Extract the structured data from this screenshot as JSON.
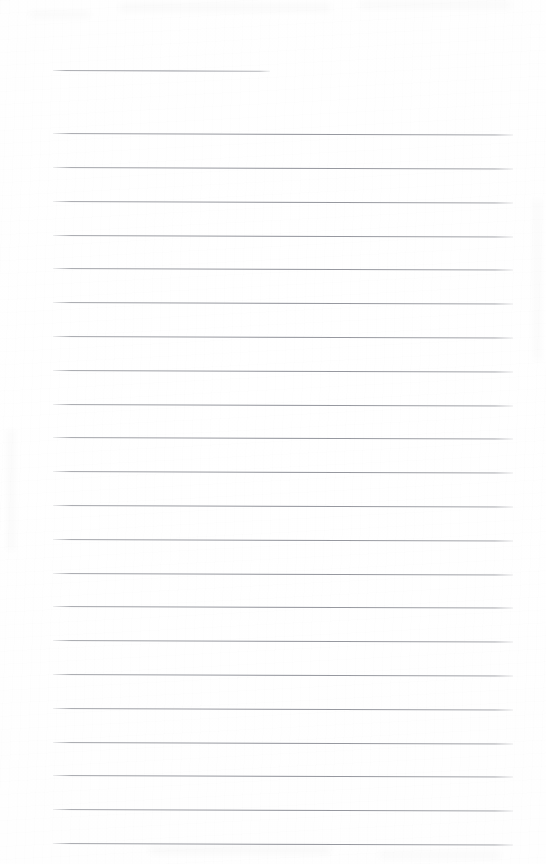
{
  "document": {
    "kind": "blank-ruled-notebook-page",
    "page_width": 546,
    "page_height": 864,
    "background_color": "#fdfdfd",
    "rule_color": "#8e9096",
    "handwriting_text": "",
    "typed_text": "",
    "page_number": "",
    "header_text": "",
    "footer_text": ""
  },
  "layout": {
    "left_margin_x": 53,
    "right_margin_x": 513,
    "first_rule_y": 70,
    "body_first_rule_y": 133,
    "rule_spacing": 33.8,
    "skew_degrees": 0.18
  },
  "rules": [
    {
      "id": "title-rule",
      "y": 70,
      "x_start": 53,
      "x_end": 270,
      "kind": "title"
    },
    {
      "id": "rule-1",
      "y": 133,
      "x_start": 53,
      "x_end": 513,
      "kind": "body"
    },
    {
      "id": "rule-2",
      "y": 167,
      "x_start": 53,
      "x_end": 513,
      "kind": "body"
    },
    {
      "id": "rule-3",
      "y": 201,
      "x_start": 53,
      "x_end": 513,
      "kind": "body"
    },
    {
      "id": "rule-4",
      "y": 235,
      "x_start": 53,
      "x_end": 513,
      "kind": "body"
    },
    {
      "id": "rule-5",
      "y": 268,
      "x_start": 53,
      "x_end": 513,
      "kind": "body"
    },
    {
      "id": "rule-6",
      "y": 302,
      "x_start": 53,
      "x_end": 513,
      "kind": "body"
    },
    {
      "id": "rule-7",
      "y": 336,
      "x_start": 53,
      "x_end": 513,
      "kind": "body"
    },
    {
      "id": "rule-8",
      "y": 370,
      "x_start": 53,
      "x_end": 513,
      "kind": "body"
    },
    {
      "id": "rule-9",
      "y": 404,
      "x_start": 53,
      "x_end": 513,
      "kind": "body"
    },
    {
      "id": "rule-10",
      "y": 437,
      "x_start": 53,
      "x_end": 513,
      "kind": "body"
    },
    {
      "id": "rule-11",
      "y": 471,
      "x_start": 53,
      "x_end": 513,
      "kind": "body"
    },
    {
      "id": "rule-12",
      "y": 505,
      "x_start": 53,
      "x_end": 513,
      "kind": "body"
    },
    {
      "id": "rule-13",
      "y": 539,
      "x_start": 53,
      "x_end": 513,
      "kind": "body"
    },
    {
      "id": "rule-14",
      "y": 573,
      "x_start": 53,
      "x_end": 513,
      "kind": "body"
    },
    {
      "id": "rule-15",
      "y": 606,
      "x_start": 53,
      "x_end": 513,
      "kind": "body"
    },
    {
      "id": "rule-16",
      "y": 640,
      "x_start": 53,
      "x_end": 513,
      "kind": "body"
    },
    {
      "id": "rule-17",
      "y": 674,
      "x_start": 53,
      "x_end": 513,
      "kind": "body"
    },
    {
      "id": "rule-18",
      "y": 708,
      "x_start": 53,
      "x_end": 513,
      "kind": "body"
    },
    {
      "id": "rule-19",
      "y": 742,
      "x_start": 53,
      "x_end": 513,
      "kind": "body"
    },
    {
      "id": "rule-20",
      "y": 775,
      "x_start": 53,
      "x_end": 513,
      "kind": "body"
    },
    {
      "id": "rule-21",
      "y": 809,
      "x_start": 53,
      "x_end": 513,
      "kind": "body"
    },
    {
      "id": "rule-22",
      "y": 843,
      "x_start": 53,
      "x_end": 513,
      "kind": "body"
    }
  ],
  "smudges": [
    {
      "x": 120,
      "y": 4,
      "w": 210,
      "h": 7
    },
    {
      "x": 360,
      "y": 2,
      "w": 150,
      "h": 6
    },
    {
      "x": 30,
      "y": 12,
      "w": 60,
      "h": 5
    },
    {
      "x": 150,
      "y": 846,
      "w": 180,
      "h": 8
    },
    {
      "x": 380,
      "y": 852,
      "w": 120,
      "h": 6
    },
    {
      "x": 8,
      "y": 430,
      "w": 6,
      "h": 120
    },
    {
      "x": 534,
      "y": 200,
      "w": 6,
      "h": 160
    }
  ]
}
